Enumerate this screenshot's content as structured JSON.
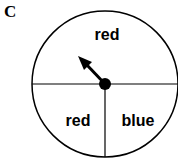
{
  "panel": {
    "label": "C"
  },
  "spinner": {
    "center": [
      105,
      84
    ],
    "radius": 73,
    "sectors": [
      {
        "id": "top",
        "label": "red",
        "fraction": 0.5
      },
      {
        "id": "bottom-left",
        "label": "red",
        "fraction": 0.25
      },
      {
        "id": "bottom-right",
        "label": "blue",
        "fraction": 0.25
      }
    ],
    "pointer": {
      "direction": "up-left",
      "points_to": "red"
    }
  }
}
